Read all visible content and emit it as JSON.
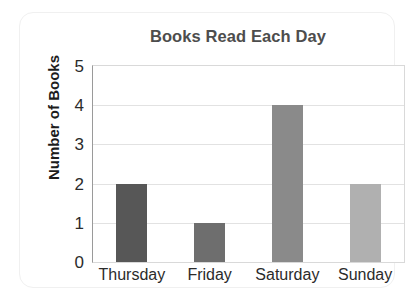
{
  "chart_data": {
    "type": "bar",
    "title": "Books Read Each Day",
    "xlabel": "",
    "ylabel": "Number of Books",
    "categories": [
      "Thursday",
      "Friday",
      "Saturday",
      "Sunday"
    ],
    "values": [
      2,
      1,
      4,
      2
    ],
    "bar_colors": [
      "#575757",
      "#6e6e6e",
      "#8a8a8a",
      "#b0b0b0"
    ],
    "ylim": [
      0,
      5
    ],
    "ytick_labels": [
      "0",
      "1",
      "2",
      "3",
      "4",
      "5"
    ],
    "yticks": [
      0,
      1,
      2,
      3,
      4,
      5
    ],
    "grid": true,
    "legend": false,
    "title_color": "#4d4d4d",
    "axis_text_color": "#2b2b2b",
    "gridline_color": "#e2e2e2",
    "plot_border_color": "#d9d9d9",
    "background_color": "#ffffff"
  }
}
